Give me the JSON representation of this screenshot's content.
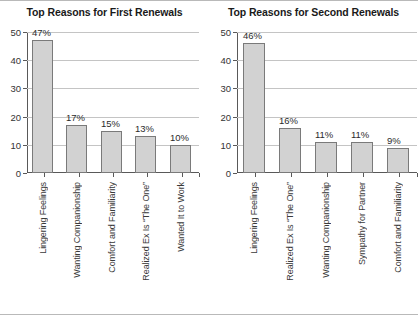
{
  "figure": {
    "background": "#ffffff",
    "border_color": "#b9b9b9",
    "bar_fill": "#d2d2d2",
    "bar_stroke": "#7a7a7a",
    "grid_color": "#c4c4c4",
    "axis_color": "#595959"
  },
  "chart_data": [
    {
      "type": "bar",
      "title": "Top Reasons for First Renewals",
      "xlabel": "",
      "ylabel": "",
      "ylim": [
        0,
        50
      ],
      "yticks": [
        0,
        10,
        20,
        30,
        40,
        50
      ],
      "ytick_labels": [
        "0",
        "10",
        "20",
        "30",
        "40",
        "50"
      ],
      "grid": true,
      "legend": "none",
      "categories": [
        "Lingering Feelings",
        "Wanting Companionship",
        "Comfort and Familiarity",
        "Realized Ex Is “The One”",
        "Wanted It to Work"
      ],
      "values": [
        47,
        17,
        15,
        13,
        10
      ],
      "data_labels": [
        "47%",
        "17%",
        "15%",
        "13%",
        "10%"
      ]
    },
    {
      "type": "bar",
      "title": "Top Reasons for Second Renewals",
      "xlabel": "",
      "ylabel": "",
      "ylim": [
        0,
        50
      ],
      "yticks": [
        0,
        10,
        20,
        30,
        40,
        50
      ],
      "ytick_labels": [
        "0",
        "10",
        "20",
        "30",
        "40",
        "50"
      ],
      "grid": true,
      "legend": "none",
      "categories": [
        "Lingering Feelings",
        "Realized Ex Is “The One”",
        "Wanting Companionship",
        "Sympathy for Partner",
        "Comfort and Familiarity"
      ],
      "values": [
        46,
        16,
        11,
        11,
        9
      ],
      "data_labels": [
        "46%",
        "16%",
        "11%",
        "11%",
        "9%"
      ]
    }
  ]
}
